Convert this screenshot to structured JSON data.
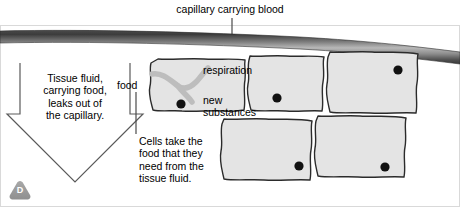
{
  "figure": {
    "title": "capillary carrying blood",
    "badge": "D",
    "labels": {
      "tissue_fluid": "Tissue fluid,\ncarrying food,\nleaks out of\nthe capillary.",
      "food": "food",
      "cells_take": "Cells take the\nfood that they\nneed from the\ntissue fluid.",
      "respiration": "respiration",
      "new_substances": "new\nsubstances"
    },
    "colors": {
      "cell_fill": "#e4e4e4",
      "cell_outline": "#2b2b2b",
      "nucleus": "#111111",
      "capillary_dark": "#3a3a3a",
      "capillary_light": "#b4b4b4",
      "channel": "#b9b9b9",
      "badge": "#9a9a9a",
      "leader_line": "#3a3a3a",
      "text": "#000000"
    },
    "structures": {
      "capillary": "capillary-tube",
      "cells": [
        {
          "name": "cell-top-1",
          "nucleus": true
        },
        {
          "name": "cell-top-2",
          "nucleus": true
        },
        {
          "name": "cell-top-3",
          "nucleus": true
        },
        {
          "name": "cell-bottom-1",
          "nucleus": true
        },
        {
          "name": "cell-bottom-2",
          "nucleus": true
        }
      ],
      "arrow": "tissue-fluid-arrow"
    }
  }
}
